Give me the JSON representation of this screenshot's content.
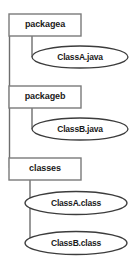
{
  "diagram": {
    "type": "package-file-tree",
    "title": "",
    "colors": {
      "box_border": "#7a7a7a",
      "box_fill": "#ffffff",
      "ellipse_border": "#3c3c3c",
      "ellipse_fill": "#ffffff",
      "connector": "#6e6e6e",
      "text": "#1a1a1a",
      "background": "#ffffff"
    },
    "packages": [
      {
        "id": "packagea",
        "label": "packagea",
        "shape": "rectangle",
        "children": [
          {
            "id": "classa-java",
            "label": "ClassA.java",
            "shape": "ellipse"
          }
        ]
      },
      {
        "id": "packageb",
        "label": "packageb",
        "shape": "rectangle",
        "children": [
          {
            "id": "classb-java",
            "label": "ClassB.java",
            "shape": "ellipse"
          }
        ]
      },
      {
        "id": "classes",
        "label": "classes",
        "shape": "rectangle",
        "children": [
          {
            "id": "classa-class",
            "label": "ClassA.class",
            "shape": "ellipse"
          },
          {
            "id": "classb-class",
            "label": "ClassB.class",
            "shape": "ellipse"
          }
        ]
      }
    ]
  }
}
